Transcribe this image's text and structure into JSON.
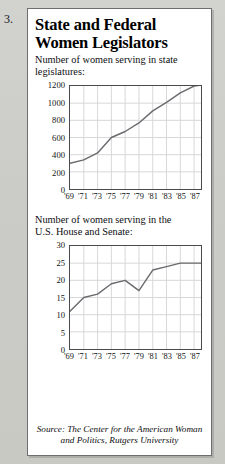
{
  "item_number": "3.",
  "headline": {
    "line1": "State and Federal",
    "line2": "Women Legislators"
  },
  "source_note": {
    "line1": "Source: The Center for the American Woman",
    "line2": "and Politics, Rutgers University"
  },
  "colors": {
    "paper": "#cfcfcb",
    "panel": "#ffffff",
    "frame": "#6f6f72",
    "axis": "#4a4a4d",
    "grid": "#d8d8da",
    "line": "#6a6a6e",
    "text": "#0d0d0f"
  },
  "chart_data": [
    {
      "type": "line",
      "title": "Number of women serving in state legislatures:",
      "title_line1": "Number of women serving in state",
      "title_line2": "legislatures:",
      "xlabel": "",
      "ylabel": "",
      "grid": true,
      "legend": "none",
      "xlim": [
        1969,
        1988
      ],
      "ylim": [
        0,
        1200
      ],
      "xticks": [
        1969,
        1971,
        1973,
        1975,
        1977,
        1979,
        1981,
        1983,
        1985,
        1987
      ],
      "xticklabels": [
        "'69",
        "'71",
        "'73",
        "'75",
        "'77",
        "'79",
        "'81",
        "'83",
        "'85",
        "'87"
      ],
      "yticks": [
        0,
        200,
        400,
        600,
        800,
        1000,
        1200
      ],
      "yticklabels": [
        "0",
        "200",
        "400",
        "600",
        "800",
        "1000",
        "1200"
      ],
      "x": [
        1969,
        1971,
        1973,
        1975,
        1977,
        1979,
        1981,
        1983,
        1985,
        1987,
        1988
      ],
      "values": [
        300,
        340,
        420,
        600,
        670,
        770,
        910,
        1010,
        1120,
        1200,
        1210
      ]
    },
    {
      "type": "line",
      "title": "Number of women serving in the U.S. House and Senate:",
      "title_line1": "Number of women serving in the",
      "title_line2": "U.S. House and Senate:",
      "xlabel": "",
      "ylabel": "",
      "grid": true,
      "legend": "none",
      "xlim": [
        1969,
        1988
      ],
      "ylim": [
        0,
        30
      ],
      "xticks": [
        1969,
        1971,
        1973,
        1975,
        1977,
        1979,
        1981,
        1983,
        1985,
        1987
      ],
      "xticklabels": [
        "'69",
        "'71",
        "'73",
        "'75",
        "'77",
        "'79",
        "'81",
        "'83",
        "'85",
        "'87"
      ],
      "yticks": [
        0,
        5,
        10,
        15,
        20,
        25,
        30
      ],
      "yticklabels": [
        "0",
        "5",
        "10",
        "15",
        "20",
        "25",
        "30"
      ],
      "x": [
        1969,
        1971,
        1973,
        1975,
        1977,
        1979,
        1981,
        1983,
        1985,
        1987,
        1988
      ],
      "values": [
        11,
        15,
        16,
        19,
        20,
        17,
        23,
        24,
        25,
        25,
        25
      ]
    }
  ]
}
